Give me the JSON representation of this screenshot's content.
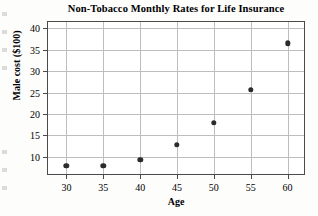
{
  "chart_data": {
    "type": "scatter",
    "title": "Non-Tobacco Monthly Rates for Life Insurance",
    "xlabel": "Age",
    "ylabel": "Male cost ($100)",
    "x": [
      30,
      35,
      40,
      45,
      50,
      55,
      60
    ],
    "values": [
      7.9,
      7.9,
      9.3,
      12.8,
      18.0,
      25.6,
      36.5
    ],
    "series": [
      {
        "name": "Male cost",
        "points": [
          {
            "age": 30,
            "cost": 7.9
          },
          {
            "age": 35,
            "cost": 7.9
          },
          {
            "age": 40,
            "cost": 9.3
          },
          {
            "age": 45,
            "cost": 12.8
          },
          {
            "age": 50,
            "cost": 18.0
          },
          {
            "age": 55,
            "cost": 25.6
          },
          {
            "age": 60,
            "cost": 36.5
          }
        ]
      }
    ],
    "xticks": [
      30,
      35,
      40,
      45,
      50,
      55,
      60
    ],
    "yticks": [
      10,
      15,
      20,
      25,
      30,
      35,
      40
    ],
    "xlim": [
      27.5,
      62.5
    ],
    "ylim": [
      5.5,
      41.5
    ],
    "grid": true,
    "legend": "none",
    "marker_color": "#2b2b2b",
    "grid_color": "#bdbdbd",
    "frame_color": "#4a4a4a",
    "background_color": "#ffffff"
  }
}
